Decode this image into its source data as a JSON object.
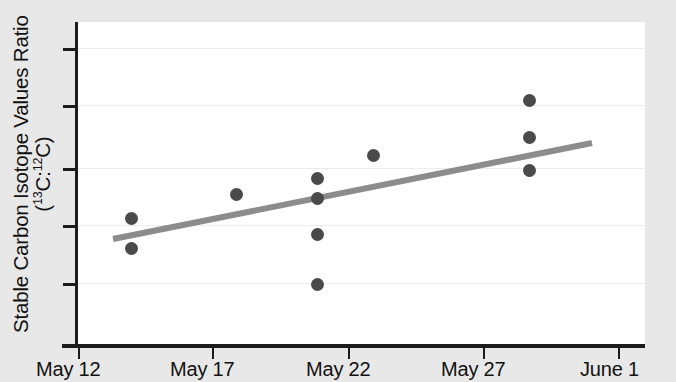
{
  "chart_data": {
    "type": "scatter",
    "title": "",
    "xlabel": "",
    "ylabel_line1": "Stable Carbon Isotope Values Ratio",
    "ylabel_line2_prefix": "(",
    "ylabel_line2": "(13C:12C)",
    "ylabel_sup1": "13",
    "ylabel_c1": "C:",
    "ylabel_sup2": "12",
    "ylabel_c2": "C)",
    "x_tick_labels": [
      "May 12",
      "May 17",
      "May 22",
      "May 27",
      "June 1"
    ],
    "x_tick_positions_px": [
      78,
      212,
      348,
      483,
      618
    ],
    "y_tick_labels": [
      "",
      "",
      "",
      "",
      ""
    ],
    "y_tick_positions_px": [
      48,
      105,
      168,
      225,
      283
    ],
    "grid": true,
    "legend": "none",
    "xlim_dates": [
      "May 12",
      "June 1"
    ],
    "points": [
      {
        "x": "May 14",
        "x_px": 131,
        "y_px": 218
      },
      {
        "x": "May 14",
        "x_px": 131,
        "y_px": 248
      },
      {
        "x": "May 18",
        "x_px": 236,
        "y_px": 194
      },
      {
        "x": "May 21",
        "x_px": 317,
        "y_px": 178
      },
      {
        "x": "May 21",
        "x_px": 317,
        "y_px": 198
      },
      {
        "x": "May 21",
        "x_px": 317,
        "y_px": 234
      },
      {
        "x": "May 21",
        "x_px": 317,
        "y_px": 284
      },
      {
        "x": "May 23",
        "x_px": 373,
        "y_px": 155
      },
      {
        "x": "May 28",
        "x_px": 529,
        "y_px": 100
      },
      {
        "x": "May 28",
        "x_px": 529,
        "y_px": 137
      },
      {
        "x": "May 28",
        "x_px": 529,
        "y_px": 170
      }
    ],
    "trendline": {
      "x1_px": 113,
      "y1_px": 239,
      "x2_px": 592,
      "y2_px": 143,
      "color": "#8c8c8c",
      "width_px": 6
    },
    "colors": {
      "marker": "#4a4a4a",
      "trendline": "#8c8c8c",
      "axis": "#1c1c1c",
      "grid": "#ececec",
      "plot_background": "#ffffff",
      "page_background": "#e8e8e8",
      "text": "#111111"
    }
  }
}
